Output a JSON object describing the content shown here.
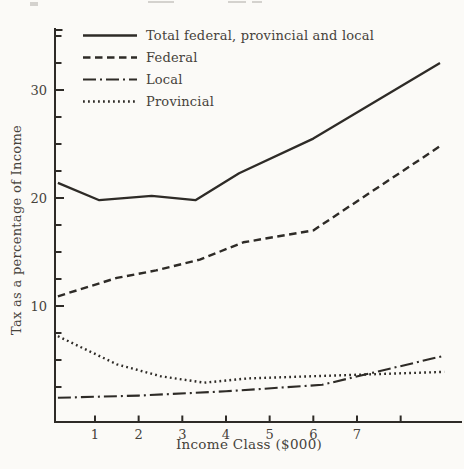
{
  "figure": {
    "background": "#fbfaf7",
    "line_color": "#2e2b27",
    "text_color": "#46423b"
  },
  "chart_data": {
    "type": "line",
    "title": "",
    "xlabel": "Income Class ($000)",
    "ylabel": "Tax as a percentage of Income",
    "xlim": [
      0,
      9.35
    ],
    "ylim": [
      0,
      36.5
    ],
    "grid": false,
    "legend_position": "upper-left",
    "x_ticks": {
      "values": [
        1,
        2,
        3,
        4,
        5,
        6,
        7,
        8
      ],
      "labels": [
        "1",
        "2",
        "3",
        "4",
        "5",
        "6",
        "7",
        ""
      ]
    },
    "y_ticks": {
      "major_values": [
        10,
        20,
        30
      ],
      "major_labels": [
        "10",
        "20",
        "30"
      ],
      "minor_step": 2.5,
      "minor_max": 35
    },
    "series": [
      {
        "name": "Total federal, provincial and local",
        "style": "solid",
        "points": [
          [
            0.15,
            21.4
          ],
          [
            1.1,
            19.8
          ],
          [
            2.3,
            20.2
          ],
          [
            3.3,
            19.8
          ],
          [
            4.3,
            22.3
          ],
          [
            6.0,
            25.5
          ],
          [
            8.9,
            32.5
          ]
        ]
      },
      {
        "name": "Federal",
        "style": "dashed",
        "points": [
          [
            0.15,
            10.9
          ],
          [
            1.5,
            12.6
          ],
          [
            2.4,
            13.3
          ],
          [
            3.4,
            14.3
          ],
          [
            4.4,
            15.9
          ],
          [
            6.0,
            17.0
          ],
          [
            8.9,
            24.8
          ]
        ]
      },
      {
        "name": "Local",
        "style": "dashdot",
        "points": [
          [
            0.15,
            1.5
          ],
          [
            2.0,
            1.7
          ],
          [
            4.0,
            2.1
          ],
          [
            6.2,
            2.7
          ],
          [
            9.0,
            5.4
          ]
        ]
      },
      {
        "name": "Provincial",
        "style": "dotted",
        "points": [
          [
            0.15,
            7.2
          ],
          [
            1.5,
            4.6
          ],
          [
            2.5,
            3.5
          ],
          [
            3.5,
            2.9
          ],
          [
            4.5,
            3.3
          ],
          [
            6.0,
            3.5
          ],
          [
            9.0,
            3.9
          ]
        ]
      }
    ]
  }
}
